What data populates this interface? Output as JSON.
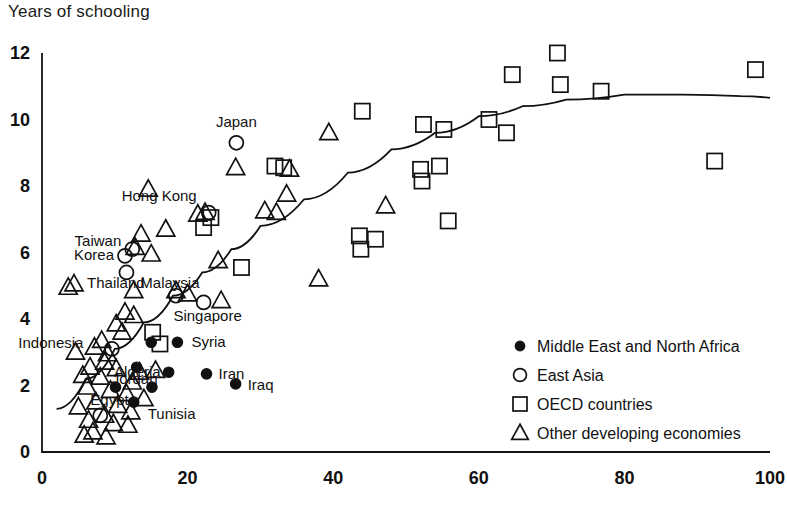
{
  "chart_data": {
    "type": "scatter",
    "title": "Years of schooling",
    "xlabel": "",
    "ylabel": "Years of schooling",
    "xlim": [
      0,
      100
    ],
    "ylim": [
      0,
      12
    ],
    "xticks": [
      0,
      20,
      40,
      60,
      80,
      100
    ],
    "yticks": [
      0,
      2,
      4,
      6,
      8,
      10,
      12
    ],
    "grid": false,
    "legend_position": "lower-right",
    "legend": [
      {
        "marker": "filled-circle",
        "label": "Middle East and North Africa"
      },
      {
        "marker": "open-circle",
        "label": "East Asia"
      },
      {
        "marker": "open-square",
        "label": "OECD countries"
      },
      {
        "marker": "open-triangle",
        "label": "Other developing economies"
      }
    ],
    "trend_line": {
      "description": "fitted concave curve rising then flattening",
      "points": [
        [
          2.0,
          1.3
        ],
        [
          6,
          2.2
        ],
        [
          10,
          3.1
        ],
        [
          14,
          3.9
        ],
        [
          18,
          4.7
        ],
        [
          22,
          5.4
        ],
        [
          26,
          6.1
        ],
        [
          30,
          6.8
        ],
        [
          36,
          7.6
        ],
        [
          42,
          8.4
        ],
        [
          48,
          9.1
        ],
        [
          54,
          9.6
        ],
        [
          60,
          10.1
        ],
        [
          66,
          10.4
        ],
        [
          72,
          10.6
        ],
        [
          80,
          10.75
        ],
        [
          88,
          10.75
        ],
        [
          96,
          10.7
        ],
        [
          100,
          10.65
        ]
      ]
    },
    "series": [
      {
        "name": "East Asia",
        "marker": "open-circle",
        "points": [
          {
            "x": 26.7,
            "y": 9.3,
            "label": "Japan"
          },
          {
            "x": 22.9,
            "y": 7.2,
            "label": "Hong Kong"
          },
          {
            "x": 12.4,
            "y": 6.1,
            "label": "Taiwan"
          },
          {
            "x": 11.4,
            "y": 5.9,
            "label": "Korea"
          },
          {
            "x": 11.6,
            "y": 5.4,
            "label": ""
          },
          {
            "x": 18.4,
            "y": 4.7,
            "label": "Malaysia"
          },
          {
            "x": 22.2,
            "y": 4.5,
            "label": "Singapore"
          },
          {
            "x": 9.6,
            "y": 3.1,
            "label": ""
          },
          {
            "x": 8.0,
            "y": 1.1,
            "label": ""
          }
        ]
      },
      {
        "name": "Middle East and North Africa",
        "marker": "filled-circle",
        "points": [
          {
            "x": 18.6,
            "y": 3.3,
            "label": "Syria"
          },
          {
            "x": 15.0,
            "y": 3.3,
            "label": ""
          },
          {
            "x": 17.4,
            "y": 2.4,
            "label": "Algeria"
          },
          {
            "x": 22.6,
            "y": 2.35,
            "label": "Iran"
          },
          {
            "x": 26.6,
            "y": 2.05,
            "label": "Iraq"
          },
          {
            "x": 15.1,
            "y": 1.95,
            "label": ""
          },
          {
            "x": 10.1,
            "y": 1.95,
            "label": "Egypt"
          },
          {
            "x": 13.0,
            "y": 2.55,
            "label": "Jordan"
          },
          {
            "x": 12.6,
            "y": 1.5,
            "label": "Tunisia"
          }
        ]
      },
      {
        "name": "OECD countries",
        "marker": "open-square",
        "points": [
          {
            "x": 70.8,
            "y": 12.0,
            "label": ""
          },
          {
            "x": 64.6,
            "y": 11.35,
            "label": ""
          },
          {
            "x": 98.0,
            "y": 11.5,
            "label": ""
          },
          {
            "x": 71.2,
            "y": 11.05,
            "label": ""
          },
          {
            "x": 76.8,
            "y": 10.85,
            "label": ""
          },
          {
            "x": 44.0,
            "y": 10.25,
            "label": ""
          },
          {
            "x": 52.4,
            "y": 9.85,
            "label": ""
          },
          {
            "x": 55.2,
            "y": 9.7,
            "label": ""
          },
          {
            "x": 61.4,
            "y": 10.0,
            "label": ""
          },
          {
            "x": 63.8,
            "y": 9.6,
            "label": ""
          },
          {
            "x": 33.2,
            "y": 8.55,
            "label": ""
          },
          {
            "x": 52.0,
            "y": 8.5,
            "label": ""
          },
          {
            "x": 54.6,
            "y": 8.6,
            "label": ""
          },
          {
            "x": 52.2,
            "y": 8.15,
            "label": ""
          },
          {
            "x": 55.8,
            "y": 6.95,
            "label": ""
          },
          {
            "x": 43.6,
            "y": 6.5,
            "label": ""
          },
          {
            "x": 45.8,
            "y": 6.4,
            "label": ""
          },
          {
            "x": 43.8,
            "y": 6.1,
            "label": ""
          },
          {
            "x": 92.4,
            "y": 8.75,
            "label": ""
          },
          {
            "x": 22.2,
            "y": 6.75,
            "label": ""
          },
          {
            "x": 23.2,
            "y": 7.05,
            "label": ""
          },
          {
            "x": 27.4,
            "y": 5.55,
            "label": ""
          },
          {
            "x": 15.2,
            "y": 3.6,
            "label": ""
          },
          {
            "x": 16.2,
            "y": 3.25,
            "label": ""
          },
          {
            "x": 32.0,
            "y": 8.6,
            "label": ""
          }
        ]
      },
      {
        "name": "Other developing economies",
        "marker": "open-triangle",
        "points": [
          {
            "x": 39.4,
            "y": 9.6,
            "label": ""
          },
          {
            "x": 26.6,
            "y": 8.55,
            "label": ""
          },
          {
            "x": 34.0,
            "y": 8.5,
            "label": ""
          },
          {
            "x": 14.6,
            "y": 7.9,
            "label": ""
          },
          {
            "x": 33.6,
            "y": 7.75,
            "label": ""
          },
          {
            "x": 47.2,
            "y": 7.4,
            "label": ""
          },
          {
            "x": 30.6,
            "y": 7.25,
            "label": ""
          },
          {
            "x": 32.2,
            "y": 7.2,
            "label": ""
          },
          {
            "x": 21.4,
            "y": 7.15,
            "label": ""
          },
          {
            "x": 22.4,
            "y": 7.2,
            "label": ""
          },
          {
            "x": 17.0,
            "y": 6.7,
            "label": ""
          },
          {
            "x": 13.6,
            "y": 6.55,
            "label": ""
          },
          {
            "x": 12.8,
            "y": 6.15,
            "label": ""
          },
          {
            "x": 15.0,
            "y": 5.95,
            "label": ""
          },
          {
            "x": 24.2,
            "y": 5.75,
            "label": ""
          },
          {
            "x": 38.0,
            "y": 5.2,
            "label": ""
          },
          {
            "x": 4.4,
            "y": 5.05,
            "label": "Thailand"
          },
          {
            "x": 12.6,
            "y": 4.85,
            "label": ""
          },
          {
            "x": 18.4,
            "y": 4.85,
            "label": ""
          },
          {
            "x": 20.0,
            "y": 4.75,
            "label": ""
          },
          {
            "x": 24.6,
            "y": 4.55,
            "label": ""
          },
          {
            "x": 11.4,
            "y": 4.2,
            "label": ""
          },
          {
            "x": 12.6,
            "y": 4.1,
            "label": ""
          },
          {
            "x": 10.2,
            "y": 3.85,
            "label": ""
          },
          {
            "x": 11.0,
            "y": 3.6,
            "label": ""
          },
          {
            "x": 8.2,
            "y": 3.35,
            "label": ""
          },
          {
            "x": 7.2,
            "y": 3.15,
            "label": "Indonesia"
          },
          {
            "x": 9.0,
            "y": 2.95,
            "label": ""
          },
          {
            "x": 8.6,
            "y": 2.7,
            "label": ""
          },
          {
            "x": 6.6,
            "y": 2.55,
            "label": ""
          },
          {
            "x": 10.2,
            "y": 2.5,
            "label": ""
          },
          {
            "x": 15.6,
            "y": 2.45,
            "label": ""
          },
          {
            "x": 13.4,
            "y": 2.4,
            "label": ""
          },
          {
            "x": 5.6,
            "y": 2.3,
            "label": ""
          },
          {
            "x": 8.0,
            "y": 2.25,
            "label": ""
          },
          {
            "x": 12.4,
            "y": 2.1,
            "label": ""
          },
          {
            "x": 6.2,
            "y": 1.95,
            "label": ""
          },
          {
            "x": 9.4,
            "y": 1.85,
            "label": ""
          },
          {
            "x": 11.6,
            "y": 1.75,
            "label": ""
          },
          {
            "x": 14.0,
            "y": 1.6,
            "label": ""
          },
          {
            "x": 7.4,
            "y": 1.5,
            "label": ""
          },
          {
            "x": 10.4,
            "y": 1.4,
            "label": ""
          },
          {
            "x": 5.0,
            "y": 1.35,
            "label": ""
          },
          {
            "x": 12.2,
            "y": 1.2,
            "label": ""
          },
          {
            "x": 8.6,
            "y": 1.1,
            "label": ""
          },
          {
            "x": 6.4,
            "y": 0.95,
            "label": ""
          },
          {
            "x": 9.8,
            "y": 0.85,
            "label": ""
          },
          {
            "x": 11.8,
            "y": 0.8,
            "label": ""
          },
          {
            "x": 7.0,
            "y": 0.6,
            "label": ""
          },
          {
            "x": 8.8,
            "y": 0.45,
            "label": ""
          },
          {
            "x": 5.8,
            "y": 0.5,
            "label": ""
          },
          {
            "x": 4.6,
            "y": 3.0,
            "label": ""
          },
          {
            "x": 3.6,
            "y": 4.95,
            "label": ""
          }
        ]
      }
    ],
    "annotations": [
      {
        "text": "Japan",
        "x": 26.7,
        "y": 9.3
      },
      {
        "text": "Hong Kong",
        "x": 22.9,
        "y": 7.2
      },
      {
        "text": "Taiwan",
        "x": 12.4,
        "y": 6.1
      },
      {
        "text": "Korea",
        "x": 11.4,
        "y": 5.9
      },
      {
        "text": "Thailand",
        "x": 4.4,
        "y": 5.05
      },
      {
        "text": "Malaysia",
        "x": 18.4,
        "y": 4.7
      },
      {
        "text": "Singapore",
        "x": 22.2,
        "y": 4.5
      },
      {
        "text": "Indonesia",
        "x": 7.2,
        "y": 3.15
      },
      {
        "text": "Syria",
        "x": 18.6,
        "y": 3.3
      },
      {
        "text": "Jordan",
        "x": 13.0,
        "y": 2.55
      },
      {
        "text": "Algeria",
        "x": 17.4,
        "y": 2.4
      },
      {
        "text": "Iran",
        "x": 22.6,
        "y": 2.35
      },
      {
        "text": "Iraq",
        "x": 26.6,
        "y": 2.05
      },
      {
        "text": "Egypt",
        "x": 10.1,
        "y": 1.95
      },
      {
        "text": "Tunisia",
        "x": 12.6,
        "y": 1.5
      }
    ]
  }
}
